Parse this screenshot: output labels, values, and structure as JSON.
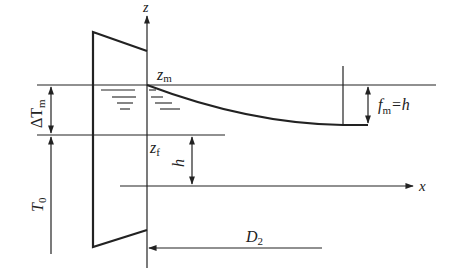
{
  "diagram": {
    "title": "",
    "axes": {
      "z_label": "z",
      "x_label": "x"
    },
    "labels": {
      "z_m": {
        "main": "z",
        "sub": "m"
      },
      "z_f": {
        "main": "z",
        "sub": "f"
      },
      "delta_T_m": {
        "main": "ΔT",
        "sub": "m"
      },
      "T_0": {
        "main": "T",
        "sub": "0"
      },
      "h": "h",
      "f_m": {
        "main": "f",
        "sub": "m",
        "suffix": "=h"
      },
      "D_2": {
        "main": "D",
        "sub": "2"
      }
    },
    "colors": {
      "stroke": "#222222",
      "background": "#ffffff"
    }
  }
}
